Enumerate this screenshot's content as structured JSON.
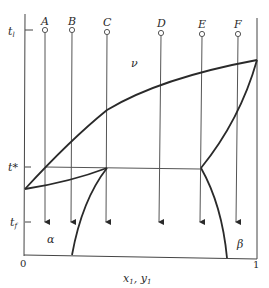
{
  "figure": {
    "type": "binary eutectic phase diagram",
    "y_axis_labels": {
      "top": "t",
      "top_sub": "l",
      "eutectic": "t*",
      "final": "t",
      "final_sub": "f"
    },
    "x_axis": {
      "label": "x",
      "label_sub1": "1",
      "label_sep": ", ",
      "label_y": "y",
      "label_sub2": "1",
      "min_label": "0",
      "max_label": "1"
    },
    "regions": {
      "vapor": "ν",
      "alpha": "α",
      "beta": "β"
    },
    "paths": [
      {
        "id": "A",
        "label": "A"
      },
      {
        "id": "B",
        "label": "B"
      },
      {
        "id": "C",
        "label": "C"
      },
      {
        "id": "D",
        "label": "D"
      },
      {
        "id": "E",
        "label": "E"
      },
      {
        "id": "F",
        "label": "F"
      }
    ],
    "colors": {
      "line": "#2a2a2a",
      "thin_line": "#555555",
      "background": "#ffffff"
    }
  }
}
